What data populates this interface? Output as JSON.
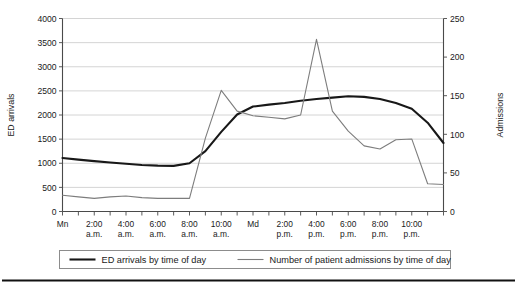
{
  "chart_data": {
    "type": "line",
    "title": "",
    "xlabel": "",
    "ylabel": "ED arrivals",
    "y2label": "Admissions",
    "ylim": [
      0,
      4000
    ],
    "y2lim": [
      0,
      250
    ],
    "yticks": [
      "0",
      "500",
      "1000",
      "1500",
      "2000",
      "2500",
      "3000",
      "3500",
      "4000"
    ],
    "y2ticks": [
      "0",
      "50",
      "100",
      "150",
      "200",
      "250"
    ],
    "grid": true,
    "legend_position": "bottom",
    "x": [
      0,
      1,
      2,
      3,
      4,
      5,
      6,
      7,
      8,
      9,
      10,
      11,
      12,
      13,
      14,
      15,
      16,
      17,
      18,
      19,
      20,
      21,
      22,
      23,
      24
    ],
    "categories": [
      "Mn",
      "",
      "2:00 a.m.",
      "",
      "4:00 a.m.",
      "",
      "6:00 a.m.",
      "",
      "8:00 a.m.",
      "",
      "10:00 a.m.",
      "",
      "Md",
      "",
      "2:00 p.m.",
      "",
      "4:00 p.m.",
      "",
      "6:00 p.m.",
      "",
      "8:00 p.m.",
      "",
      "10:00 p.m.",
      "",
      ""
    ],
    "xtick_labels": [
      {
        "x": 0,
        "line1": "Mn",
        "line2": ""
      },
      {
        "x": 2,
        "line1": "2:00",
        "line2": "a.m."
      },
      {
        "x": 4,
        "line1": "4:00",
        "line2": "a.m."
      },
      {
        "x": 6,
        "line1": "6:00",
        "line2": "a.m."
      },
      {
        "x": 8,
        "line1": "8:00",
        "line2": "a.m."
      },
      {
        "x": 10,
        "line1": "10:00",
        "line2": "a.m."
      },
      {
        "x": 12,
        "line1": "Md",
        "line2": ""
      },
      {
        "x": 14,
        "line1": "2:00",
        "line2": "p.m."
      },
      {
        "x": 16,
        "line1": "4:00",
        "line2": "p.m."
      },
      {
        "x": 18,
        "line1": "6:00",
        "line2": "p.m."
      },
      {
        "x": 20,
        "line1": "8:00",
        "line2": "p.m."
      },
      {
        "x": 22,
        "line1": "10:00",
        "line2": "p.m."
      }
    ],
    "series": [
      {
        "name": "ED arrivals by time of day",
        "axis": "left",
        "color": "#181818",
        "width": 2.1,
        "values": [
          1110,
          1075,
          1045,
          1015,
          990,
          965,
          950,
          945,
          1000,
          1250,
          1650,
          2010,
          2175,
          2215,
          2250,
          2295,
          2330,
          2360,
          2390,
          2375,
          2330,
          2250,
          2130,
          1840,
          1420
        ]
      },
      {
        "name": "Number of patient admissions by time of day",
        "axis": "right",
        "color": "#7d7d7d",
        "width": 1.1,
        "values": [
          21,
          19,
          17,
          19,
          20,
          18,
          17,
          17,
          17,
          95,
          157,
          130,
          124,
          122,
          120,
          125,
          223,
          130,
          104,
          85,
          81,
          93,
          94,
          36,
          35
        ]
      }
    ],
    "legend": [
      {
        "label": "ED arrivals by time of day",
        "color": "#181818",
        "width": 2.1
      },
      {
        "label": "Number of patient admissions by time of day",
        "color": "#7d7d7d",
        "width": 1.1
      }
    ]
  }
}
